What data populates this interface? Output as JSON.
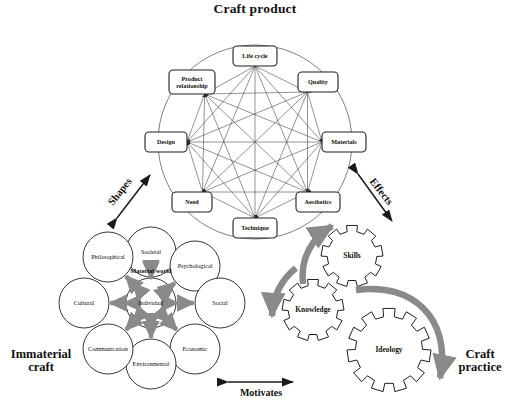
{
  "diagram": {
    "title": "Craft product",
    "sections": {
      "craft_product": "Craft product",
      "immaterial_craft": "Immaterial craft",
      "craft_practice": "Craft practice"
    },
    "relations": {
      "shapes": "Shapes",
      "effects": "Effects",
      "motivates": "Motivates"
    },
    "octagon": {
      "label": "Craft product",
      "nodes": [
        {
          "id": "life-cycle",
          "label": "Life cycle",
          "x": 255,
          "y": 56,
          "w": 44,
          "h": 20
        },
        {
          "id": "quality",
          "label": "Quality",
          "x": 318,
          "y": 82,
          "w": 40,
          "h": 20
        },
        {
          "id": "materials",
          "label": "Materials",
          "x": 344,
          "y": 142,
          "w": 44,
          "h": 20
        },
        {
          "id": "aesthetics",
          "label": "Aesthetics",
          "x": 318,
          "y": 202,
          "w": 44,
          "h": 20
        },
        {
          "id": "technique",
          "label": "Technique",
          "x": 255,
          "y": 228,
          "w": 44,
          "h": 20
        },
        {
          "id": "need",
          "label": "Need",
          "x": 192,
          "y": 202,
          "w": 40,
          "h": 20
        },
        {
          "id": "design",
          "label": "Design",
          "x": 166,
          "y": 142,
          "w": 42,
          "h": 20
        },
        {
          "id": "product-relationship",
          "label": "Product relationship",
          "x": 192,
          "y": 82,
          "w": 46,
          "h": 24
        }
      ]
    },
    "bubbles": {
      "label": "Immaterial craft",
      "center": {
        "id": "individual",
        "label": "Individual",
        "x": 151,
        "y": 303,
        "r": 25
      },
      "material_world_label": "Material world",
      "ring": [
        {
          "id": "societal",
          "label": "Societal",
          "x": 151,
          "y": 252,
          "r": 25
        },
        {
          "id": "psychological",
          "label": "Psychological",
          "x": 195,
          "y": 266,
          "r": 25
        },
        {
          "id": "social",
          "label": "Social",
          "x": 220,
          "y": 303,
          "r": 25
        },
        {
          "id": "economic",
          "label": "Economic",
          "x": 195,
          "y": 349,
          "r": 25
        },
        {
          "id": "environmental",
          "label": "Environmental",
          "x": 151,
          "y": 364,
          "r": 25
        },
        {
          "id": "communication",
          "label": "Communication",
          "x": 108,
          "y": 349,
          "r": 25
        },
        {
          "id": "cultural",
          "label": "Cultural",
          "x": 84,
          "y": 303,
          "r": 25
        },
        {
          "id": "philosophical",
          "label": "Philosophical",
          "x": 108,
          "y": 257,
          "r": 25
        }
      ]
    },
    "gears": {
      "label": "Craft practice",
      "items": [
        {
          "id": "skills",
          "label": "Skills",
          "x": 352,
          "y": 256,
          "r": 31,
          "teeth": 9
        },
        {
          "id": "knowledge",
          "label": "Knowledge",
          "x": 313,
          "y": 310,
          "r": 31,
          "teeth": 9
        },
        {
          "id": "ideology",
          "label": "Ideology",
          "x": 389,
          "y": 350,
          "r": 42,
          "teeth": 11
        }
      ]
    },
    "colors": {
      "stroke": "#2b2b2b",
      "gray_arrow": "#8a8a8a",
      "text": "#111111",
      "background": "#ffffff"
    }
  }
}
